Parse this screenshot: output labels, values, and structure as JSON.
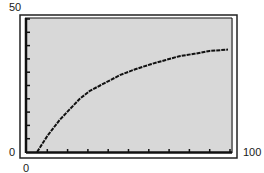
{
  "chart_data": {
    "type": "line",
    "title": "",
    "xlabel": "",
    "ylabel": "",
    "xlim": [
      0,
      100
    ],
    "ylim": [
      0,
      50
    ],
    "tick_labels": {
      "x_min": "0",
      "x_max": "100",
      "y_min": "0",
      "y_max": "50"
    },
    "x_tick_step": 10,
    "y_tick_step": 5,
    "grid": false,
    "legend": null,
    "series": [
      {
        "name": "curve",
        "x": [
          5,
          10,
          16,
          21,
          26,
          31,
          36,
          41,
          46,
          53,
          61,
          68,
          75,
          83,
          90,
          99
        ],
        "y": [
          0,
          6,
          12,
          16,
          20,
          23,
          25,
          27,
          29,
          31,
          33,
          34.5,
          36,
          37,
          38,
          38.5
        ]
      }
    ],
    "colors": {
      "plot_bg": "#d8d8d8",
      "frame": "#111111",
      "line": "#111111"
    }
  }
}
